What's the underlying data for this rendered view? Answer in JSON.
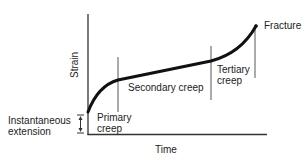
{
  "diagram": {
    "axes": {
      "x_label": "Time",
      "y_label": "Strain"
    },
    "stages": [
      {
        "name": "primary",
        "label_line1": "Primary",
        "label_line2": "creep"
      },
      {
        "name": "secondary",
        "label": "Secondary creep"
      },
      {
        "name": "tertiary",
        "label_line1": "Tertiary",
        "label_line2": "creep"
      }
    ],
    "annotations": {
      "fracture": "Fracture",
      "instantaneous_line1": "Instantaneous",
      "instantaneous_line2": "extension"
    },
    "colors": {
      "line": "#111111",
      "divider": "#333333",
      "text": "#222222"
    }
  }
}
